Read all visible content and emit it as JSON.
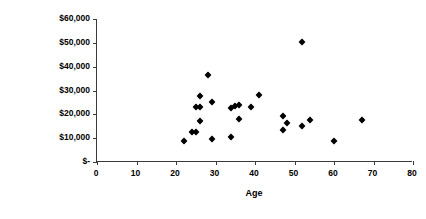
{
  "chart_data": {
    "type": "scatter",
    "title": "",
    "xlabel": "Age",
    "ylabel": "Family Income",
    "xlim": [
      0,
      80
    ],
    "ylim": [
      0,
      60000
    ],
    "grid": false,
    "legend": null,
    "marker": "diamond",
    "marker_color": "#000000",
    "x_ticks": [
      0,
      10,
      20,
      30,
      40,
      50,
      60,
      70,
      80
    ],
    "x_tick_labels": [
      "0",
      "10",
      "20",
      "30",
      "40",
      "50",
      "60",
      "70",
      "80"
    ],
    "y_ticks": [
      0,
      10000,
      20000,
      30000,
      40000,
      50000,
      60000
    ],
    "y_tick_labels": [
      "$-",
      "$10,000",
      "$20,000",
      "$30,000",
      "$40,000",
      "$50,000",
      "$60,000"
    ],
    "point_count": 24,
    "points": [
      {
        "age": 22,
        "income": 9000
      },
      {
        "age": 24,
        "income": 12500
      },
      {
        "age": 25,
        "income": 12500
      },
      {
        "age": 26,
        "income": 17000
      },
      {
        "age": 25,
        "income": 23000
      },
      {
        "age": 26,
        "income": 23000
      },
      {
        "age": 26,
        "income": 27500
      },
      {
        "age": 28,
        "income": 36500
      },
      {
        "age": 29,
        "income": 25000
      },
      {
        "age": 29,
        "income": 9500
      },
      {
        "age": 34,
        "income": 10500
      },
      {
        "age": 34,
        "income": 22500
      },
      {
        "age": 35,
        "income": 23500
      },
      {
        "age": 36,
        "income": 18000
      },
      {
        "age": 36,
        "income": 24000
      },
      {
        "age": 39,
        "income": 23000
      },
      {
        "age": 41,
        "income": 28000
      },
      {
        "age": 47,
        "income": 19500
      },
      {
        "age": 47,
        "income": 13500
      },
      {
        "age": 48,
        "income": 16500
      },
      {
        "age": 52,
        "income": 50500
      },
      {
        "age": 52,
        "income": 15000
      },
      {
        "age": 54,
        "income": 17500
      },
      {
        "age": 60,
        "income": 9000
      },
      {
        "age": 67,
        "income": 17500
      }
    ],
    "axis_color": "#3a3a3a",
    "plot_background": "#FFFFFF"
  }
}
